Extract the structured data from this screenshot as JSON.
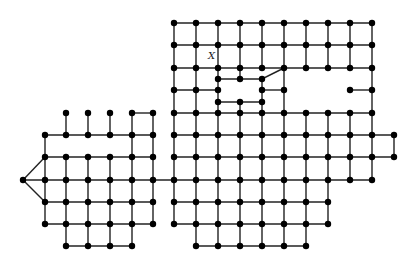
{
  "diagram": {
    "type": "grid-graph",
    "label_x": {
      "text": "X",
      "x": 208,
      "y": 59
    },
    "colors": {
      "edge": "#222222",
      "node": "#000000",
      "background": "#ffffff"
    },
    "node_radius": 3.2,
    "cols": {
      "L": [
        45,
        66,
        88,
        110,
        132,
        153
      ],
      "R": [
        174,
        196,
        218,
        240,
        262,
        284,
        306,
        328,
        350,
        372,
        394
      ]
    },
    "rows": [
      23,
      45,
      68,
      90,
      113,
      135,
      157,
      180,
      202,
      224,
      246
    ],
    "apex": [
      23,
      180
    ],
    "polylines": [
      [
        [
          174,
          23
        ],
        [
          372,
          23
        ]
      ],
      [
        [
          174,
          45
        ],
        [
          372,
          45
        ]
      ],
      [
        [
          174,
          68
        ],
        [
          372,
          68
        ]
      ],
      [
        [
          174,
          90
        ],
        [
          218,
          90
        ]
      ],
      [
        [
          262,
          90
        ],
        [
          284,
          90
        ]
      ],
      [
        [
          350,
          90
        ],
        [
          372,
          90
        ]
      ],
      [
        [
          218,
          79
        ],
        [
          262,
          79
        ],
        [
          284,
          68
        ]
      ],
      [
        [
          218,
          102
        ],
        [
          262,
          102
        ]
      ],
      [
        [
          174,
          113
        ],
        [
          372,
          113
        ]
      ],
      [
        [
          174,
          135
        ],
        [
          394,
          135
        ]
      ],
      [
        [
          174,
          157
        ],
        [
          394,
          157
        ]
      ],
      [
        [
          23,
          180
        ],
        [
          372,
          180
        ]
      ],
      [
        [
          174,
          202
        ],
        [
          328,
          202
        ]
      ],
      [
        [
          174,
          224
        ],
        [
          328,
          224
        ]
      ],
      [
        [
          196,
          246
        ],
        [
          306,
          246
        ]
      ],
      [
        [
          174,
          23
        ],
        [
          174,
          224
        ]
      ],
      [
        [
          196,
          23
        ],
        [
          196,
          246
        ]
      ],
      [
        [
          218,
          23
        ],
        [
          218,
          246
        ]
      ],
      [
        [
          240,
          23
        ],
        [
          240,
          79
        ]
      ],
      [
        [
          240,
          102
        ],
        [
          240,
          246
        ]
      ],
      [
        [
          262,
          23
        ],
        [
          262,
          68
        ]
      ],
      [
        [
          262,
          79
        ],
        [
          262,
          246
        ]
      ],
      [
        [
          284,
          23
        ],
        [
          284,
          246
        ]
      ],
      [
        [
          306,
          23
        ],
        [
          306,
          68
        ]
      ],
      [
        [
          306,
          113
        ],
        [
          306,
          246
        ]
      ],
      [
        [
          328,
          23
        ],
        [
          328,
          68
        ]
      ],
      [
        [
          328,
          113
        ],
        [
          328,
          224
        ]
      ],
      [
        [
          350,
          23
        ],
        [
          350,
          68
        ]
      ],
      [
        [
          350,
          113
        ],
        [
          350,
          180
        ]
      ],
      [
        [
          372,
          23
        ],
        [
          372,
          180
        ]
      ],
      [
        [
          394,
          135
        ],
        [
          394,
          157
        ]
      ],
      [
        [
          66,
          113
        ],
        [
          66,
          135
        ]
      ],
      [
        [
          88,
          113
        ],
        [
          88,
          135
        ]
      ],
      [
        [
          110,
          113
        ],
        [
          110,
          135
        ]
      ],
      [
        [
          132,
          113
        ],
        [
          153,
          113
        ]
      ],
      [
        [
          132,
          113
        ],
        [
          132,
          246
        ]
      ],
      [
        [
          153,
          113
        ],
        [
          153,
          224
        ]
      ],
      [
        [
          45,
          135
        ],
        [
          153,
          135
        ]
      ],
      [
        [
          45,
          157
        ],
        [
          153,
          157
        ]
      ],
      [
        [
          45,
          202
        ],
        [
          153,
          202
        ]
      ],
      [
        [
          45,
          224
        ],
        [
          153,
          224
        ]
      ],
      [
        [
          66,
          246
        ],
        [
          132,
          246
        ]
      ],
      [
        [
          45,
          135
        ],
        [
          45,
          224
        ]
      ],
      [
        [
          66,
          157
        ],
        [
          66,
          246
        ]
      ],
      [
        [
          88,
          157
        ],
        [
          88,
          246
        ]
      ],
      [
        [
          110,
          157
        ],
        [
          110,
          246
        ]
      ],
      [
        [
          23,
          180
        ],
        [
          45,
          157
        ]
      ],
      [
        [
          23,
          180
        ],
        [
          45,
          202
        ]
      ]
    ],
    "nodes": [
      [
        174,
        23
      ],
      [
        196,
        23
      ],
      [
        218,
        23
      ],
      [
        240,
        23
      ],
      [
        262,
        23
      ],
      [
        284,
        23
      ],
      [
        306,
        23
      ],
      [
        328,
        23
      ],
      [
        350,
        23
      ],
      [
        372,
        23
      ],
      [
        174,
        45
      ],
      [
        196,
        45
      ],
      [
        218,
        45
      ],
      [
        240,
        45
      ],
      [
        262,
        45
      ],
      [
        284,
        45
      ],
      [
        306,
        45
      ],
      [
        328,
        45
      ],
      [
        350,
        45
      ],
      [
        372,
        45
      ],
      [
        174,
        68
      ],
      [
        196,
        68
      ],
      [
        218,
        68
      ],
      [
        240,
        68
      ],
      [
        262,
        68
      ],
      [
        284,
        68
      ],
      [
        306,
        68
      ],
      [
        328,
        68
      ],
      [
        350,
        68
      ],
      [
        372,
        68
      ],
      [
        218,
        79
      ],
      [
        240,
        79
      ],
      [
        262,
        79
      ],
      [
        174,
        90
      ],
      [
        196,
        90
      ],
      [
        218,
        90
      ],
      [
        262,
        90
      ],
      [
        284,
        90
      ],
      [
        350,
        90
      ],
      [
        372,
        90
      ],
      [
        218,
        102
      ],
      [
        240,
        102
      ],
      [
        262,
        102
      ],
      [
        174,
        113
      ],
      [
        196,
        113
      ],
      [
        218,
        113
      ],
      [
        240,
        113
      ],
      [
        262,
        113
      ],
      [
        284,
        113
      ],
      [
        306,
        113
      ],
      [
        328,
        113
      ],
      [
        350,
        113
      ],
      [
        372,
        113
      ],
      [
        174,
        135
      ],
      [
        196,
        135
      ],
      [
        218,
        135
      ],
      [
        240,
        135
      ],
      [
        262,
        135
      ],
      [
        284,
        135
      ],
      [
        306,
        135
      ],
      [
        328,
        135
      ],
      [
        350,
        135
      ],
      [
        372,
        135
      ],
      [
        394,
        135
      ],
      [
        174,
        157
      ],
      [
        196,
        157
      ],
      [
        218,
        157
      ],
      [
        240,
        157
      ],
      [
        262,
        157
      ],
      [
        284,
        157
      ],
      [
        306,
        157
      ],
      [
        328,
        157
      ],
      [
        350,
        157
      ],
      [
        372,
        157
      ],
      [
        394,
        157
      ],
      [
        174,
        180
      ],
      [
        196,
        180
      ],
      [
        218,
        180
      ],
      [
        240,
        180
      ],
      [
        262,
        180
      ],
      [
        284,
        180
      ],
      [
        306,
        180
      ],
      [
        328,
        180
      ],
      [
        350,
        180
      ],
      [
        372,
        180
      ],
      [
        174,
        202
      ],
      [
        196,
        202
      ],
      [
        218,
        202
      ],
      [
        240,
        202
      ],
      [
        262,
        202
      ],
      [
        284,
        202
      ],
      [
        306,
        202
      ],
      [
        328,
        202
      ],
      [
        174,
        224
      ],
      [
        196,
        224
      ],
      [
        218,
        224
      ],
      [
        240,
        224
      ],
      [
        262,
        224
      ],
      [
        284,
        224
      ],
      [
        306,
        224
      ],
      [
        328,
        224
      ],
      [
        196,
        246
      ],
      [
        218,
        246
      ],
      [
        240,
        246
      ],
      [
        262,
        246
      ],
      [
        284,
        246
      ],
      [
        306,
        246
      ],
      [
        66,
        113
      ],
      [
        88,
        113
      ],
      [
        110,
        113
      ],
      [
        132,
        113
      ],
      [
        153,
        113
      ],
      [
        45,
        135
      ],
      [
        66,
        135
      ],
      [
        88,
        135
      ],
      [
        110,
        135
      ],
      [
        132,
        135
      ],
      [
        153,
        135
      ],
      [
        45,
        157
      ],
      [
        66,
        157
      ],
      [
        88,
        157
      ],
      [
        110,
        157
      ],
      [
        132,
        157
      ],
      [
        153,
        157
      ],
      [
        23,
        180
      ],
      [
        45,
        180
      ],
      [
        66,
        180
      ],
      [
        88,
        180
      ],
      [
        110,
        180
      ],
      [
        132,
        180
      ],
      [
        153,
        180
      ],
      [
        45,
        202
      ],
      [
        66,
        202
      ],
      [
        88,
        202
      ],
      [
        110,
        202
      ],
      [
        132,
        202
      ],
      [
        153,
        202
      ],
      [
        45,
        224
      ],
      [
        66,
        224
      ],
      [
        88,
        224
      ],
      [
        110,
        224
      ],
      [
        132,
        224
      ],
      [
        153,
        224
      ],
      [
        66,
        246
      ],
      [
        88,
        246
      ],
      [
        110,
        246
      ],
      [
        132,
        246
      ]
    ]
  }
}
